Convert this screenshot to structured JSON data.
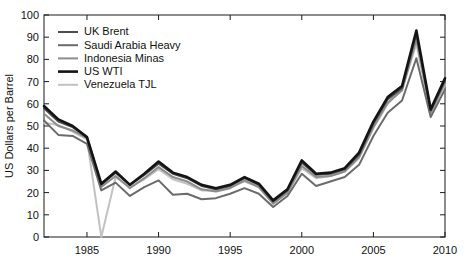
{
  "chart_data": {
    "type": "line",
    "title": "",
    "xlabel": "",
    "ylabel": "US Dollars per Barrel",
    "xlim": [
      1982,
      2010
    ],
    "ylim": [
      0,
      100
    ],
    "grid": false,
    "legend_position": "top-left",
    "xticks": [
      1985,
      1990,
      1995,
      2000,
      2005,
      2010
    ],
    "yticks": [
      0,
      10,
      20,
      30,
      40,
      50,
      60,
      70,
      80,
      90,
      100
    ],
    "x": [
      1982,
      1983,
      1984,
      1985,
      1986,
      1987,
      1988,
      1989,
      1990,
      1991,
      1992,
      1993,
      1994,
      1995,
      1996,
      1997,
      1998,
      1999,
      2000,
      2001,
      2002,
      2003,
      2004,
      2005,
      2006,
      2007,
      2008,
      2009,
      2010
    ],
    "series": [
      {
        "name": "UK Brent",
        "color": "#4d4d4d",
        "width": 2.0,
        "values": [
          58.0,
          52.0,
          49.5,
          45.0,
          23.5,
          29.0,
          23.5,
          28.0,
          33.0,
          28.5,
          26.5,
          23.0,
          21.5,
          23.0,
          26.5,
          23.5,
          16.0,
          21.0,
          33.5,
          28.0,
          28.5,
          30.5,
          37.0,
          51.0,
          62.0,
          67.0,
          91.5,
          57.0,
          70.5
        ]
      },
      {
        "name": "Saudi Arabia Heavy",
        "color": "#6b6b6b",
        "width": 2.0,
        "values": [
          52.5,
          46.0,
          45.5,
          42.0,
          21.0,
          24.5,
          18.5,
          22.5,
          25.5,
          19.0,
          19.5,
          17.0,
          17.5,
          19.5,
          22.0,
          19.5,
          13.5,
          18.5,
          28.5,
          23.0,
          25.0,
          27.0,
          32.5,
          45.5,
          56.0,
          61.5,
          80.5,
          54.0,
          66.5
        ]
      },
      {
        "name": "Indonesia Minas",
        "color": "#8c8c8c",
        "width": 2.0,
        "values": [
          55.5,
          50.0,
          48.0,
          44.5,
          22.5,
          27.5,
          22.0,
          26.5,
          31.5,
          27.0,
          25.0,
          21.5,
          20.5,
          22.0,
          25.5,
          22.5,
          15.0,
          20.0,
          32.0,
          27.0,
          27.5,
          29.5,
          36.0,
          49.5,
          60.5,
          66.0,
          89.0,
          56.0,
          69.5
        ]
      },
      {
        "name": "US WTI",
        "color": "#141414",
        "width": 2.6,
        "values": [
          59.0,
          53.0,
          50.0,
          45.0,
          24.0,
          29.5,
          23.5,
          28.5,
          34.0,
          29.0,
          27.0,
          23.5,
          22.0,
          23.5,
          27.0,
          24.0,
          16.5,
          21.5,
          34.5,
          28.5,
          29.0,
          31.0,
          38.0,
          52.0,
          63.0,
          68.0,
          93.0,
          57.5,
          71.5
        ]
      },
      {
        "name": "Venezuela TJL",
        "color": "#c2c2c2",
        "width": 2.0,
        "values": [
          51.5,
          50.5,
          47.5,
          44.0,
          0.0,
          27.0,
          22.5,
          26.0,
          30.5,
          26.0,
          24.0,
          21.0,
          21.0,
          22.5,
          25.0,
          22.5,
          15.0,
          20.0,
          31.0,
          26.5,
          27.5,
          29.5,
          35.5,
          49.0,
          60.0,
          66.5,
          87.0,
          55.5,
          68.5
        ]
      }
    ]
  }
}
